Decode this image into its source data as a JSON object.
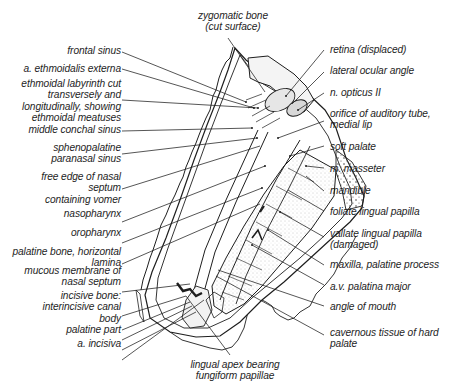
{
  "diagram": {
    "type": "anatomical-line-drawing",
    "colors": {
      "ink": "#1e1e1e",
      "background": "#ffffff",
      "stipple": "#9a9a9a"
    }
  },
  "labels": {
    "top": {
      "zygomatic_bone": [
        "zygomatic bone",
        "(cut surface)"
      ]
    },
    "left": [
      {
        "id": "frontal-sinus",
        "lines": [
          "frontal sinus"
        ]
      },
      {
        "id": "a-ethmoidalis-externa",
        "lines": [
          "a. ethmoidalis externa"
        ]
      },
      {
        "id": "ethmoidal-labyrinth",
        "lines": [
          "ethmoidal labyrinth cut",
          "transversely and",
          "longitudinally, showing",
          "ethmoidal meatuses"
        ]
      },
      {
        "id": "middle-conchal-sinus",
        "lines": [
          "middle conchal sinus"
        ]
      },
      {
        "id": "sphenopalatine-paranasal-sinus",
        "lines": [
          "sphenopalatine",
          "paranasal sinus"
        ]
      },
      {
        "id": "free-edge-nasal-septum",
        "lines": [
          "free edge of nasal",
          "septum",
          "containing vomer"
        ]
      },
      {
        "id": "nasopharynx",
        "lines": [
          "nasopharynx"
        ]
      },
      {
        "id": "oropharynx",
        "lines": [
          "oropharynx"
        ]
      },
      {
        "id": "palatine-bone-horizontal-lamina",
        "lines": [
          "palatine bone, horizontal",
          "lamina"
        ]
      },
      {
        "id": "mucous-membrane-nasal-septum",
        "lines": [
          "mucous membrane of",
          "nasal septum"
        ]
      },
      {
        "id": "incisive-bone",
        "lines": [
          "incisive bone:",
          "interincisive canal",
          "body",
          "palatine part"
        ]
      },
      {
        "id": "a-incisiva",
        "lines": [
          "a. incisiva"
        ]
      }
    ],
    "right": [
      {
        "id": "retina-displaced",
        "lines": [
          "retina (displaced)"
        ]
      },
      {
        "id": "lateral-ocular-angle",
        "lines": [
          "lateral ocular angle"
        ]
      },
      {
        "id": "n-opticus-ii",
        "lines": [
          "n. opticus II"
        ]
      },
      {
        "id": "orifice-auditory-tube",
        "lines": [
          "orifice of  auditory tube,",
          "medial lip"
        ]
      },
      {
        "id": "soft-palate",
        "lines": [
          "soft palate"
        ]
      },
      {
        "id": "m-masseter",
        "lines": [
          "m. masseter"
        ]
      },
      {
        "id": "mandible",
        "lines": [
          "mandible"
        ]
      },
      {
        "id": "foliate-lingual-papilla",
        "lines": [
          "foliate lingual papilla"
        ]
      },
      {
        "id": "vallate-lingual-papilla",
        "lines": [
          "vallate lingual papilla",
          "(damaged)"
        ]
      },
      {
        "id": "maxilla-palatine-process",
        "lines": [
          "maxilla, palatine process"
        ]
      },
      {
        "id": "av-palatina-major",
        "lines": [
          "a.v. palatina major"
        ]
      },
      {
        "id": "angle-of-mouth",
        "lines": [
          "angle of mouth"
        ]
      },
      {
        "id": "cavernous-tissue-hard-palate",
        "lines": [
          "cavernous tissue of hard",
          "palate"
        ]
      }
    ],
    "bottom": {
      "lingual_apex": [
        "lingual apex bearing",
        "fungiform papillae"
      ]
    }
  }
}
